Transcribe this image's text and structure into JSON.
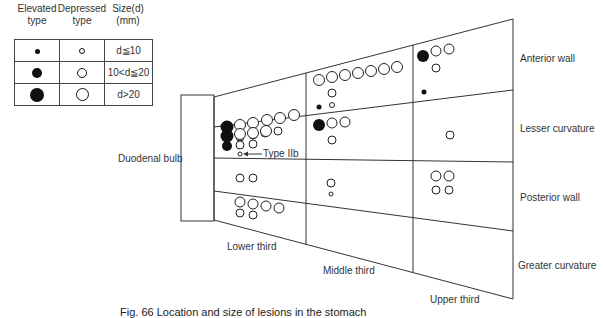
{
  "legend": {
    "headers": [
      {
        "line1": "Elevated",
        "line2": "type"
      },
      {
        "line1": "Depressed",
        "line2": "type"
      },
      {
        "line1": "Size(d)",
        "line2": "(mm)"
      }
    ],
    "rows": [
      {
        "size": "d≦10",
        "elevated_diam": 5,
        "depressed_diam": 5
      },
      {
        "size": "10<d≦20",
        "elevated_diam": 10,
        "depressed_diam": 10
      },
      {
        "size": "d>20",
        "elevated_diam": 14,
        "depressed_diam": 13
      }
    ]
  },
  "labels": {
    "duodenal_bulb": "Duodenal bulb",
    "type_iib": "Type IIb",
    "lower_third": "Lower third",
    "middle_third": "Middle third",
    "upper_third": "Upper third",
    "anterior_wall": "Anterior wall",
    "lesser_curvature": "Lesser curvature",
    "posterior_wall": "Posterior wall",
    "greater_curvature": "Greater curvature"
  },
  "caption": "Fig. 66   Location and size of lesions in the stomach",
  "lesions": [
    {
      "region": "lower-anterior",
      "type": "elevated",
      "cx": 227,
      "cy": 127,
      "r": 6.5
    },
    {
      "region": "lower-anterior",
      "type": "depressed",
      "cx": 240,
      "cy": 125,
      "r": 5.5
    },
    {
      "region": "lower-anterior",
      "type": "depressed",
      "cx": 253,
      "cy": 123,
      "r": 5.5
    },
    {
      "region": "lower-anterior",
      "type": "depressed",
      "cx": 267,
      "cy": 120,
      "r": 5.5
    },
    {
      "region": "lower-anterior",
      "type": "depressed",
      "cx": 280,
      "cy": 118,
      "r": 5.5
    },
    {
      "region": "lower-anterior",
      "type": "depressed",
      "cx": 294,
      "cy": 115,
      "r": 5.5
    },
    {
      "region": "lower-anterior",
      "type": "depressed",
      "cx": 240,
      "cy": 137,
      "r": 4
    },
    {
      "region": "lower-anterior",
      "type": "depressed",
      "cx": 253,
      "cy": 135,
      "r": 4
    },
    {
      "region": "lower-anterior",
      "type": "depressed",
      "cx": 265,
      "cy": 133,
      "r": 4
    },
    {
      "region": "lower-anterior",
      "type": "depressed",
      "cx": 278,
      "cy": 131,
      "r": 4
    },
    {
      "region": "lower-anterior",
      "type": "depressed",
      "cx": 240,
      "cy": 145,
      "r": 2.5
    },
    {
      "region": "lower-anterior",
      "type": "depressed",
      "cx": 253,
      "cy": 143,
      "r": 2.5
    },
    {
      "region": "lower-lesser",
      "type": "elevated",
      "cx": 227,
      "cy": 136,
      "r": 6.5
    },
    {
      "region": "lower-lesser",
      "type": "depressed",
      "cx": 240,
      "cy": 134,
      "r": 5.5
    },
    {
      "region": "lower-lesser",
      "type": "depressed",
      "cx": 253,
      "cy": 133,
      "r": 5.5
    },
    {
      "region": "lower-lesser",
      "type": "depressed",
      "cx": 266,
      "cy": 131,
      "r": 5.5
    },
    {
      "region": "lower-lesser",
      "type": "elevated",
      "cx": 227,
      "cy": 146,
      "r": 5
    },
    {
      "region": "lower-lesser",
      "type": "depressed",
      "cx": 240,
      "cy": 145,
      "r": 4
    },
    {
      "region": "lower-lesser",
      "type": "depressed",
      "cx": 253,
      "cy": 144,
      "r": 4
    },
    {
      "region": "lower-lesser",
      "type": "depressed",
      "cx": 240,
      "cy": 154,
      "r": 2
    },
    {
      "region": "lower-posterior",
      "type": "depressed",
      "cx": 240,
      "cy": 178,
      "r": 4
    },
    {
      "region": "lower-posterior",
      "type": "depressed",
      "cx": 253,
      "cy": 178,
      "r": 4
    },
    {
      "region": "lower-greater",
      "type": "depressed",
      "cx": 240,
      "cy": 202,
      "r": 5
    },
    {
      "region": "lower-greater",
      "type": "depressed",
      "cx": 253,
      "cy": 204,
      "r": 5
    },
    {
      "region": "lower-greater",
      "type": "depressed",
      "cx": 266,
      "cy": 206,
      "r": 5
    },
    {
      "region": "lower-greater",
      "type": "depressed",
      "cx": 279,
      "cy": 208,
      "r": 5
    },
    {
      "region": "lower-greater",
      "type": "depressed",
      "cx": 240,
      "cy": 213,
      "r": 4
    },
    {
      "region": "lower-greater",
      "type": "depressed",
      "cx": 253,
      "cy": 215,
      "r": 4
    },
    {
      "region": "middle-anterior",
      "type": "depressed",
      "cx": 319,
      "cy": 80,
      "r": 5.5
    },
    {
      "region": "middle-anterior",
      "type": "depressed",
      "cx": 332,
      "cy": 77,
      "r": 5.5
    },
    {
      "region": "middle-anterior",
      "type": "depressed",
      "cx": 345,
      "cy": 75,
      "r": 5.5
    },
    {
      "region": "middle-anterior",
      "type": "depressed",
      "cx": 358,
      "cy": 73,
      "r": 5.5
    },
    {
      "region": "middle-anterior",
      "type": "depressed",
      "cx": 371,
      "cy": 71,
      "r": 5.5
    },
    {
      "region": "middle-anterior",
      "type": "depressed",
      "cx": 384,
      "cy": 69,
      "r": 5.5
    },
    {
      "region": "middle-anterior",
      "type": "depressed",
      "cx": 397,
      "cy": 67,
      "r": 5.5
    },
    {
      "region": "middle-anterior",
      "type": "depressed",
      "cx": 332,
      "cy": 93,
      "r": 4
    },
    {
      "region": "middle-anterior",
      "type": "elevated",
      "cx": 319,
      "cy": 107,
      "r": 2.5
    },
    {
      "region": "middle-anterior",
      "type": "depressed",
      "cx": 332,
      "cy": 105,
      "r": 2.5
    },
    {
      "region": "middle-lesser",
      "type": "elevated",
      "cx": 319,
      "cy": 125,
      "r": 6
    },
    {
      "region": "middle-lesser",
      "type": "depressed",
      "cx": 332,
      "cy": 123,
      "r": 5
    },
    {
      "region": "middle-lesser",
      "type": "depressed",
      "cx": 345,
      "cy": 122,
      "r": 5
    },
    {
      "region": "middle-lesser",
      "type": "depressed",
      "cx": 332,
      "cy": 140,
      "r": 4
    },
    {
      "region": "middle-posterior",
      "type": "depressed",
      "cx": 331,
      "cy": 183,
      "r": 4
    },
    {
      "region": "middle-posterior",
      "type": "depressed",
      "cx": 331,
      "cy": 194,
      "r": 2
    },
    {
      "region": "upper-anterior",
      "type": "elevated",
      "cx": 423,
      "cy": 56,
      "r": 6
    },
    {
      "region": "upper-anterior",
      "type": "depressed",
      "cx": 436,
      "cy": 51,
      "r": 5
    },
    {
      "region": "upper-anterior",
      "type": "depressed",
      "cx": 449,
      "cy": 49,
      "r": 5
    },
    {
      "region": "upper-anterior",
      "type": "depressed",
      "cx": 436,
      "cy": 68,
      "r": 4
    },
    {
      "region": "upper-anterior",
      "type": "elevated",
      "cx": 424,
      "cy": 92,
      "r": 2.5
    },
    {
      "region": "upper-lesser",
      "type": "depressed",
      "cx": 450,
      "cy": 135,
      "r": 4
    },
    {
      "region": "upper-posterior",
      "type": "depressed",
      "cx": 436,
      "cy": 176,
      "r": 5
    },
    {
      "region": "upper-posterior",
      "type": "depressed",
      "cx": 449,
      "cy": 176,
      "r": 5
    },
    {
      "region": "upper-posterior",
      "type": "depressed",
      "cx": 436,
      "cy": 190,
      "r": 4
    },
    {
      "region": "upper-posterior",
      "type": "depressed",
      "cx": 449,
      "cy": 190,
      "r": 4
    }
  ]
}
